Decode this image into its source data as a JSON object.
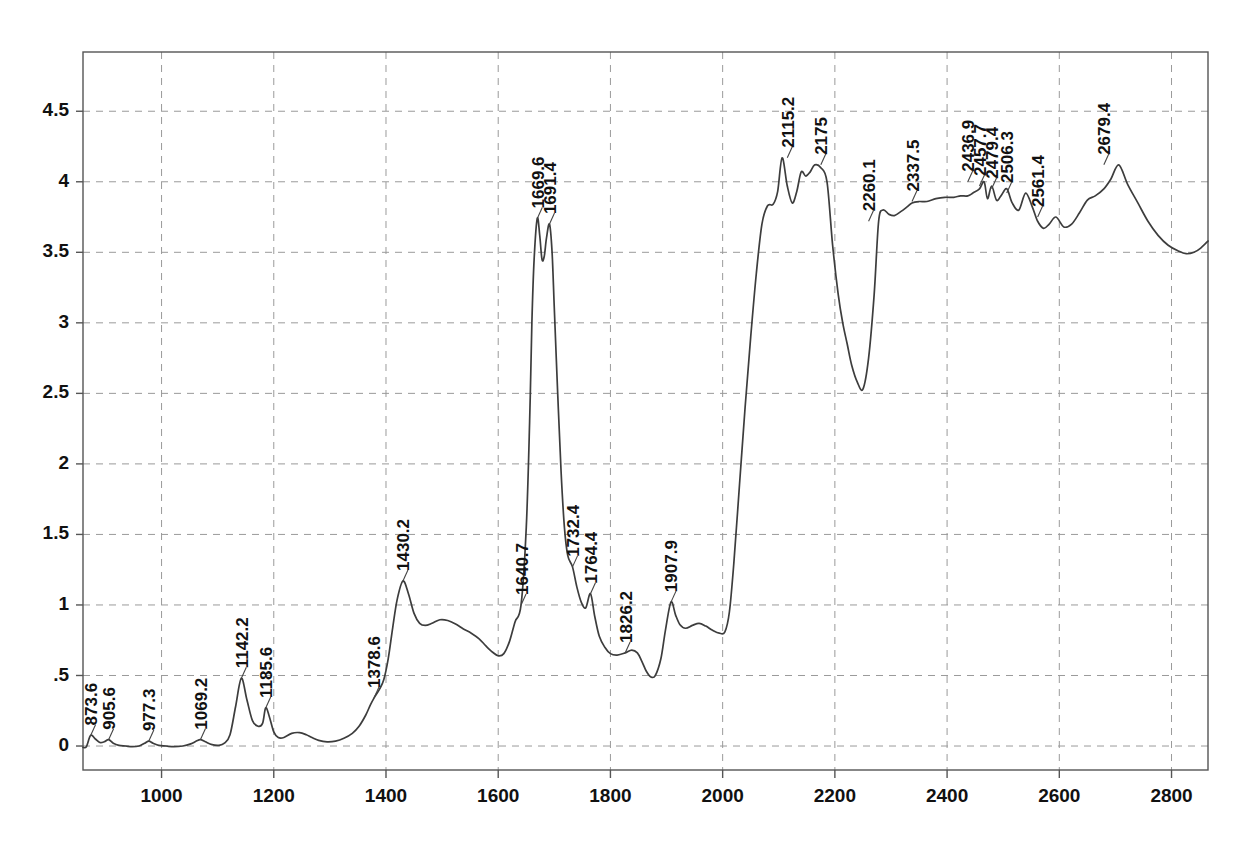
{
  "chart_data": {
    "type": "line",
    "title": "",
    "subtitle": "",
    "xlabel": "",
    "ylabel": "",
    "xlim": [
      860,
      2865
    ],
    "ylim": [
      -0.17,
      4.92
    ],
    "grid": true,
    "legend": "none",
    "legend_entries": [],
    "xticks": [
      1000,
      1200,
      1400,
      1600,
      1800,
      2000,
      2200,
      2400,
      2600,
      2800
    ],
    "xticklabels": [
      "1000",
      "1200",
      "1400",
      "1600",
      "1800",
      "2000",
      "2200",
      "2400",
      "2600",
      "2800"
    ],
    "yticks": [
      0,
      0.5,
      1,
      1.5,
      2,
      2.5,
      3,
      3.5,
      4,
      4.5
    ],
    "yticklabels": [
      "0",
      ".5",
      "1",
      "1.5",
      "2",
      "2.5",
      "3",
      "3.5",
      "4",
      "4.5"
    ],
    "line_color": "#3d3d3d",
    "grid_color": "#9a9a9a",
    "axis_color": "#555555",
    "background": "#ffffff",
    "annotations": [
      {
        "label": "873.6",
        "x": 873.6,
        "y": 0.075
      },
      {
        "label": "905.6",
        "x": 905.6,
        "y": 0.045
      },
      {
        "label": "977.3",
        "x": 977.3,
        "y": 0.035
      },
      {
        "label": "1069.2",
        "x": 1069.2,
        "y": 0.045
      },
      {
        "label": "1142.2",
        "x": 1142.2,
        "y": 0.48
      },
      {
        "label": "1185.6",
        "x": 1185.6,
        "y": 0.27
      },
      {
        "label": "1378.6",
        "x": 1378.6,
        "y": 0.34
      },
      {
        "label": "1430.2",
        "x": 1430.2,
        "y": 1.17
      },
      {
        "label": "1640.7",
        "x": 1640.7,
        "y": 1.0
      },
      {
        "label": "1669.6",
        "x": 1669.6,
        "y": 3.74
      },
      {
        "label": "1691.4",
        "x": 1691.4,
        "y": 3.7
      },
      {
        "label": "1732.4",
        "x": 1732.4,
        "y": 1.27
      },
      {
        "label": "1764.4",
        "x": 1764.4,
        "y": 1.08
      },
      {
        "label": "1826.2",
        "x": 1826.2,
        "y": 0.66
      },
      {
        "label": "1907.9",
        "x": 1907.9,
        "y": 1.02
      },
      {
        "label": "2115.2",
        "x": 2115.2,
        "y": 4.17
      },
      {
        "label": "2175",
        "x": 2175.0,
        "y": 4.12
      },
      {
        "label": "2260.1",
        "x": 2260.1,
        "y": 3.72
      },
      {
        "label": "2337.5",
        "x": 2337.5,
        "y": 3.86
      },
      {
        "label": "2436.9",
        "x": 2436.9,
        "y": 4.0
      },
      {
        "label": "2457.7",
        "x": 2457.7,
        "y": 3.97
      },
      {
        "label": "2479.4",
        "x": 2479.4,
        "y": 3.95
      },
      {
        "label": "2506.3",
        "x": 2506.3,
        "y": 3.92
      },
      {
        "label": "2561.4",
        "x": 2561.4,
        "y": 3.75
      },
      {
        "label": "2679.4",
        "x": 2679.4,
        "y": 4.12
      }
    ],
    "x": [
      860,
      866,
      873.6,
      882,
      890,
      898,
      905.6,
      914,
      924,
      936,
      948,
      960,
      970,
      977.3,
      985,
      995,
      1008,
      1022,
      1038,
      1052,
      1062,
      1069.2,
      1078,
      1090,
      1102,
      1112,
      1122,
      1132,
      1142.2,
      1152,
      1162,
      1172,
      1180,
      1185.6,
      1192,
      1200,
      1208,
      1218,
      1232,
      1246,
      1258,
      1268,
      1280,
      1295,
      1310,
      1325,
      1340,
      1352,
      1364,
      1372,
      1378.6,
      1388,
      1396,
      1404,
      1412,
      1420,
      1430.2,
      1440,
      1450,
      1460,
      1470,
      1482,
      1496,
      1510,
      1524,
      1538,
      1552,
      1566,
      1578,
      1590,
      1600,
      1610,
      1620,
      1630,
      1640.7,
      1650,
      1656,
      1660,
      1664,
      1669.6,
      1674,
      1678,
      1682,
      1686,
      1691.4,
      1696,
      1700,
      1706,
      1712,
      1718,
      1724,
      1732.4,
      1740,
      1748,
      1756,
      1764.4,
      1772,
      1780,
      1790,
      1800,
      1812,
      1826.2,
      1838,
      1848,
      1856,
      1864,
      1872,
      1880,
      1890,
      1898,
      1907.9,
      1916,
      1924,
      1934,
      1946,
      1958,
      1970,
      1982,
      1994,
      2004,
      2012,
      2020,
      2030,
      2040,
      2050,
      2060,
      2070,
      2080,
      2090,
      2098,
      2106,
      2115.2,
      2124,
      2132,
      2140,
      2148,
      2156,
      2164,
      2175,
      2186,
      2196,
      2206,
      2214,
      2222,
      2230,
      2240,
      2250,
      2260.1,
      2270,
      2278,
      2286,
      2296,
      2306,
      2318,
      2328,
      2337.5,
      2350,
      2364,
      2380,
      2396,
      2412,
      2424,
      2436.9,
      2446,
      2457.7,
      2466,
      2472,
      2479.4,
      2488,
      2496,
      2506.3,
      2516,
      2528,
      2540,
      2552,
      2561.4,
      2572,
      2582,
      2594,
      2608,
      2622,
      2636,
      2650,
      2664,
      2679.4,
      2692,
      2706,
      2722,
      2740,
      2758,
      2776,
      2794,
      2812,
      2826,
      2840,
      2852,
      2865
    ],
    "y": [
      -0.01,
      -0.005,
      0.075,
      0.05,
      0.025,
      0.03,
      0.045,
      0.02,
      0.005,
      0.0,
      -0.005,
      0.0,
      0.02,
      0.035,
      0.02,
      0.005,
      0.0,
      -0.005,
      0.0,
      0.015,
      0.035,
      0.045,
      0.03,
      0.01,
      0.005,
      0.02,
      0.08,
      0.28,
      0.48,
      0.33,
      0.18,
      0.14,
      0.16,
      0.27,
      0.21,
      0.1,
      0.06,
      0.06,
      0.09,
      0.095,
      0.08,
      0.06,
      0.04,
      0.03,
      0.035,
      0.055,
      0.09,
      0.14,
      0.22,
      0.29,
      0.34,
      0.4,
      0.47,
      0.62,
      0.84,
      1.04,
      1.17,
      1.08,
      0.94,
      0.87,
      0.855,
      0.87,
      0.895,
      0.89,
      0.865,
      0.83,
      0.8,
      0.76,
      0.71,
      0.665,
      0.64,
      0.655,
      0.74,
      0.88,
      1.0,
      1.55,
      2.3,
      3.0,
      3.45,
      3.74,
      3.62,
      3.45,
      3.47,
      3.6,
      3.7,
      3.5,
      3.1,
      2.5,
      1.95,
      1.55,
      1.35,
      1.27,
      1.13,
      1.02,
      0.98,
      1.08,
      0.92,
      0.78,
      0.7,
      0.655,
      0.645,
      0.66,
      0.68,
      0.66,
      0.6,
      0.53,
      0.49,
      0.5,
      0.62,
      0.82,
      1.02,
      0.93,
      0.86,
      0.835,
      0.855,
      0.87,
      0.85,
      0.82,
      0.8,
      0.81,
      0.95,
      1.3,
      1.85,
      2.4,
      2.9,
      3.35,
      3.7,
      3.83,
      3.84,
      3.93,
      4.17,
      3.97,
      3.85,
      3.93,
      4.07,
      4.04,
      4.07,
      4.12,
      4.1,
      4.0,
      3.55,
      3.2,
      3.0,
      2.85,
      2.7,
      2.58,
      2.53,
      2.75,
      3.2,
      3.72,
      3.8,
      3.77,
      3.76,
      3.79,
      3.82,
      3.85,
      3.86,
      3.86,
      3.88,
      3.89,
      3.89,
      3.9,
      3.9,
      3.92,
      3.95,
      4.0,
      3.88,
      3.97,
      3.87,
      3.9,
      3.95,
      3.85,
      3.8,
      3.92,
      3.82,
      3.72,
      3.67,
      3.7,
      3.75,
      3.68,
      3.7,
      3.78,
      3.87,
      3.9,
      3.95,
      4.02,
      4.12,
      3.98,
      3.85,
      3.72,
      3.62,
      3.55,
      3.51,
      3.49,
      3.5,
      3.53,
      3.58,
      3.63,
      3.7
    ]
  }
}
